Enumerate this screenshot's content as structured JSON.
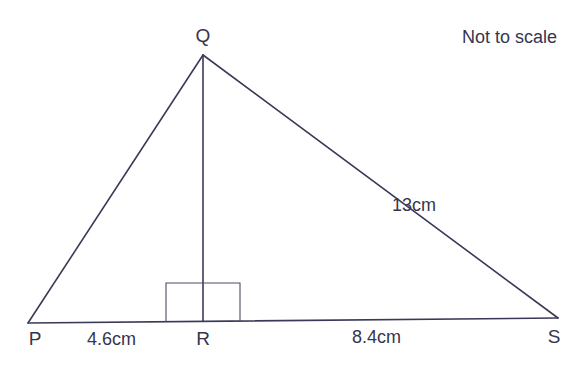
{
  "note": "Not to scale",
  "vertices": {
    "P": "P",
    "Q": "Q",
    "R": "R",
    "S": "S"
  },
  "measurements": {
    "PR": "4.6cm",
    "RS": "8.4cm",
    "QS": "13cm"
  },
  "annotations": {
    "right_angle_at": "R",
    "perpendicular": "QR"
  },
  "colors": {
    "line": "#3a3a58",
    "text": "#36354f"
  }
}
